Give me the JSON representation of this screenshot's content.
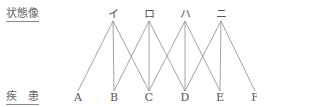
{
  "labels": {
    "top": "状態像",
    "bottom": "疾　患"
  },
  "top_nodes": [
    {
      "id": "i",
      "label": "イ",
      "x": 113
    },
    {
      "id": "ro",
      "label": "ロ",
      "x": 149
    },
    {
      "id": "ha",
      "label": "ハ",
      "x": 185
    },
    {
      "id": "ni",
      "label": "ニ",
      "x": 221
    }
  ],
  "bottom_nodes": [
    {
      "id": "A",
      "label": "A",
      "x": 78
    },
    {
      "id": "B",
      "label": "B",
      "x": 114
    },
    {
      "id": "C",
      "label": "C",
      "x": 149
    },
    {
      "id": "D",
      "label": "D",
      "x": 185
    },
    {
      "id": "E",
      "label": "E",
      "x": 220
    },
    {
      "id": "F",
      "label": "F",
      "x": 255
    }
  ],
  "edges": [
    [
      "イ",
      "A"
    ],
    [
      "イ",
      "B"
    ],
    [
      "イ",
      "C"
    ],
    [
      "ロ",
      "B"
    ],
    [
      "ロ",
      "C"
    ],
    [
      "ロ",
      "D"
    ],
    [
      "ハ",
      "C"
    ],
    [
      "ハ",
      "D"
    ],
    [
      "ハ",
      "E"
    ],
    [
      "ニ",
      "D"
    ],
    [
      "ニ",
      "E"
    ],
    [
      "ニ",
      "F"
    ]
  ]
}
